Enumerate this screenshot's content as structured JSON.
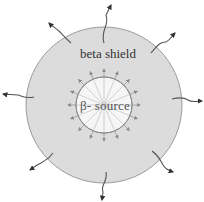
{
  "diagram": {
    "shield_label": "beta shield",
    "source_label": "β- source",
    "colors": {
      "shield_fill": "#dcdcdc",
      "shield_stroke": "#9a9a9a",
      "source_fill": "#ffffff",
      "source_stroke": "#8a8a8a",
      "ray_color": "#9a9a9a",
      "escape_arrow_color": "#555555"
    },
    "geometry": {
      "center": [
        104,
        105
      ],
      "shield_radius": 78,
      "source_radius": 28,
      "ray_count": 16
    },
    "escaping_radiation": [
      {
        "direction": "top",
        "from": [
          104,
          43
        ],
        "to": [
          111,
          5
        ]
      },
      {
        "direction": "top-right",
        "from": [
          151,
          53
        ],
        "to": [
          175,
          33
        ]
      },
      {
        "direction": "right",
        "from": [
          172,
          99
        ],
        "to": [
          202,
          101
        ]
      },
      {
        "direction": "bottom-right",
        "from": [
          152,
          151
        ],
        "to": [
          173,
          172
        ]
      },
      {
        "direction": "bottom",
        "from": [
          106,
          172
        ],
        "to": [
          102,
          200
        ]
      },
      {
        "direction": "bottom-left",
        "from": [
          53,
          153
        ],
        "to": [
          30,
          170
        ]
      },
      {
        "direction": "left",
        "from": [
          34,
          97
        ],
        "to": [
          3,
          94
        ]
      },
      {
        "direction": "top-left",
        "from": [
          71,
          43
        ],
        "to": [
          49,
          23
        ]
      }
    ]
  }
}
